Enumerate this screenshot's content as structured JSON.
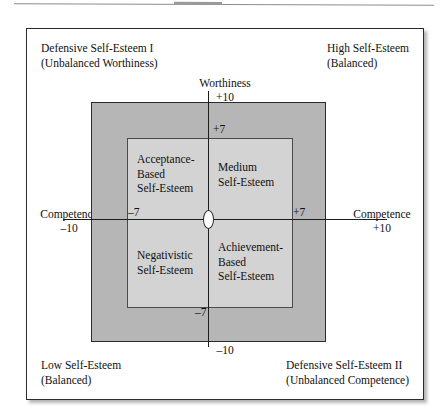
{
  "figure": {
    "corners": {
      "top_left": {
        "line1": "Defensive Self-Esteem I",
        "line2": "(Unbalanced Worthiness)"
      },
      "top_right": {
        "line1": "High Self-Esteem",
        "line2": "(Balanced)"
      },
      "bottom_left": {
        "line1": "Low Self-Esteem",
        "line2": "(Balanced)"
      },
      "bottom_right": {
        "line1": "Defensive Self-Esteem II",
        "line2": "(Unbalanced Competence)"
      }
    },
    "axes": {
      "top": {
        "name": "Worthiness",
        "value": "+10"
      },
      "bottom": {
        "name": "Worthiness",
        "value": "–10"
      },
      "left": {
        "name": "Competence",
        "value": "–10"
      },
      "right": {
        "name": "Competence",
        "value": "+10"
      }
    },
    "ticks": {
      "top": "+7",
      "bottom": "–7",
      "left": "–7",
      "right": "+7"
    },
    "quadrants": {
      "top_left": {
        "line1": "Acceptance-",
        "line2": "Based",
        "line3": "Self-Esteem"
      },
      "top_right": {
        "line1": "Medium",
        "line2": "Self-Esteem",
        "line3": ""
      },
      "bottom_left": {
        "line1": "Negativistic",
        "line2": "Self-Esteem",
        "line3": ""
      },
      "bottom_right": {
        "line1": "Achievement-",
        "line2": "Based",
        "line3": "Self-Esteem"
      }
    },
    "colors": {
      "outer_band": "#b6b6b6",
      "inner_band": "#d3d3d3",
      "frame_border": "#2b2b2b",
      "axis_line": "#1d1d1d",
      "origin_marker": "#ffffff"
    }
  }
}
